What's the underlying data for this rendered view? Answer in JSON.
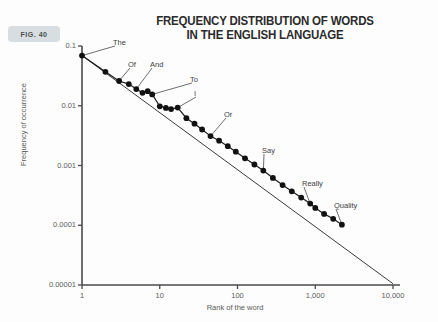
{
  "figure": {
    "tag": "FIG. 40"
  },
  "chart_data": {
    "type": "scatter",
    "title": "FREQUENCY DISTRIBUTION OF WORDS IN THE ENGLISH LANGUAGE",
    "title_lines": [
      "FREQUENCY DISTRIBUTION OF WORDS",
      "IN THE ENGLISH LANGUAGE"
    ],
    "xlabel": "Rank of the word",
    "ylabel": "Frequency of occurrence",
    "xscale": "log",
    "yscale": "log",
    "xlim": [
      1,
      10000
    ],
    "ylim": [
      1e-05,
      0.1
    ],
    "grid": false,
    "legend": null,
    "xticks": [
      {
        "value": 1,
        "label": "1"
      },
      {
        "value": 10,
        "label": "10"
      },
      {
        "value": 100,
        "label": "100"
      },
      {
        "value": 1000,
        "label": "1,000"
      },
      {
        "value": 10000,
        "label": "10,000"
      }
    ],
    "yticks": [
      {
        "value": 0.1,
        "label": "0.1"
      },
      {
        "value": 0.01,
        "label": "0.01"
      },
      {
        "value": 0.001,
        "label": "0.001"
      },
      {
        "value": 0.0001,
        "label": "0.0001"
      },
      {
        "value": 1e-05,
        "label": "0.00001"
      }
    ],
    "fit_line": {
      "x": [
        1,
        10000
      ],
      "y": [
        0.069,
        1.05e-05
      ]
    },
    "points": [
      {
        "rank": 1,
        "freq": 0.069
      },
      {
        "rank": 2,
        "freq": 0.037
      },
      {
        "rank": 3,
        "freq": 0.026
      },
      {
        "rank": 4,
        "freq": 0.023
      },
      {
        "rank": 5,
        "freq": 0.019
      },
      {
        "rank": 6,
        "freq": 0.0165
      },
      {
        "rank": 7,
        "freq": 0.0175
      },
      {
        "rank": 8,
        "freq": 0.0155
      },
      {
        "rank": 10,
        "freq": 0.0098
      },
      {
        "rank": 12,
        "freq": 0.0092
      },
      {
        "rank": 14,
        "freq": 0.0088
      },
      {
        "rank": 17,
        "freq": 0.0093
      },
      {
        "rank": 22,
        "freq": 0.0062
      },
      {
        "rank": 28,
        "freq": 0.005
      },
      {
        "rank": 35,
        "freq": 0.004
      },
      {
        "rank": 45,
        "freq": 0.0031
      },
      {
        "rank": 58,
        "freq": 0.0026
      },
      {
        "rank": 75,
        "freq": 0.0021
      },
      {
        "rank": 95,
        "freq": 0.0017
      },
      {
        "rank": 125,
        "freq": 0.00132
      },
      {
        "rank": 165,
        "freq": 0.00104
      },
      {
        "rank": 215,
        "freq": 0.00082
      },
      {
        "rank": 285,
        "freq": 0.00062
      },
      {
        "rank": 380,
        "freq": 0.00047
      },
      {
        "rank": 500,
        "freq": 0.00037
      },
      {
        "rank": 660,
        "freq": 0.00029
      },
      {
        "rank": 860,
        "freq": 0.00023
      },
      {
        "rank": 1000,
        "freq": 0.000195
      },
      {
        "rank": 1300,
        "freq": 0.000155
      },
      {
        "rank": 1700,
        "freq": 0.000128
      },
      {
        "rank": 2200,
        "freq": 0.000102
      }
    ],
    "annotations": [
      {
        "label": "The",
        "rank": 1,
        "freq": 0.069,
        "lx": 113,
        "ly": 38
      },
      {
        "label": "Of",
        "rank": 3,
        "freq": 0.026,
        "lx": 128,
        "ly": 60
      },
      {
        "label": "And",
        "rank": 5,
        "freq": 0.019,
        "lx": 150,
        "ly": 60
      },
      {
        "label": "To",
        "rank": 8,
        "freq": 0.0155,
        "lx": 190,
        "ly": 75
      },
      {
        "label": "I",
        "rank": 17,
        "freq": 0.0093,
        "lx": 194,
        "ly": 89
      },
      {
        "label": "Or",
        "rank": 45,
        "freq": 0.0031,
        "lx": 224,
        "ly": 110
      },
      {
        "label": "Say",
        "rank": 215,
        "freq": 0.00082,
        "lx": 262,
        "ly": 146
      },
      {
        "label": "Really",
        "rank": 860,
        "freq": 0.00023,
        "lx": 302,
        "ly": 179
      },
      {
        "label": "Quality",
        "rank": 2200,
        "freq": 0.000102,
        "lx": 334,
        "ly": 201
      }
    ]
  }
}
